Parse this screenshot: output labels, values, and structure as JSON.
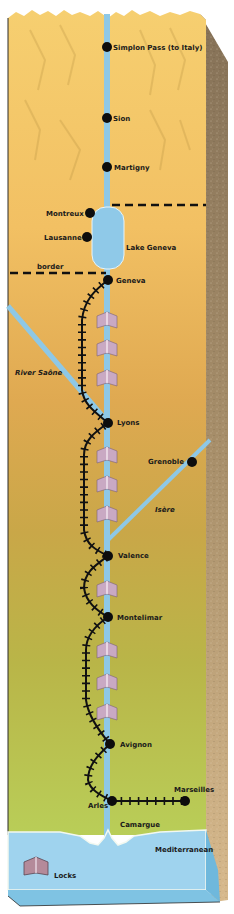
{
  "colors": {
    "land_top": "#f5cc6b",
    "land_mid": "#dcae4e",
    "land_low": "#c9c24a",
    "land_bottom": "#b8d35a",
    "river": "#8ec8e6",
    "sea": "#9fd3ee",
    "earth": "#8a7658",
    "rail": "#111111",
    "lock": "#c9a9c3"
  },
  "places": [
    {
      "name": "Simplon Pass (to Italy)",
      "x": 107,
      "y": 47
    },
    {
      "name": "Sion",
      "x": 107,
      "y": 118
    },
    {
      "name": "Martigny",
      "x": 107,
      "y": 167
    },
    {
      "name": "Montreux",
      "x": 90,
      "y": 213
    },
    {
      "name": "Lausanne",
      "x": 87,
      "y": 237
    },
    {
      "name": "Geneva",
      "x": 108,
      "y": 280
    },
    {
      "name": "Lyons",
      "x": 108,
      "y": 423
    },
    {
      "name": "Grenoble",
      "x": 192,
      "y": 462
    },
    {
      "name": "Valence",
      "x": 108,
      "y": 556
    },
    {
      "name": "Montelimar",
      "x": 108,
      "y": 617
    },
    {
      "name": "Avignon",
      "x": 110,
      "y": 744
    },
    {
      "name": "Arles",
      "x": 112,
      "y": 801
    },
    {
      "name": "Marseilles",
      "x": 185,
      "y": 801
    }
  ],
  "water_labels": {
    "lake": "Lake Geneva",
    "saone": "River Saône",
    "isere": "Isère",
    "camargue": "Camargue",
    "sea": "Mediterranean"
  },
  "border_label": "border",
  "legend": {
    "locks_label": "Locks"
  }
}
